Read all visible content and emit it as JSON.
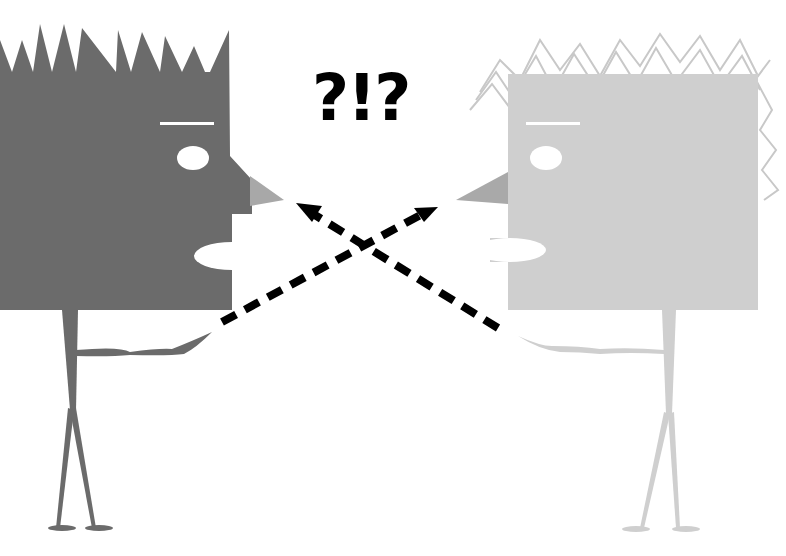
{
  "illustration": {
    "title": "Two square-headed figures pointing at each other",
    "exclamation_text": "?!?",
    "colors": {
      "background": "#ffffff",
      "left_figure": "#6b6b6b",
      "left_nose": "#a8a8a8",
      "right_figure": "#cfcfcf",
      "right_nose": "#a9a9a9",
      "eye": "#ffffff",
      "arrow": "#000000"
    },
    "left_figure": {
      "label": "left-figure",
      "hair": "spiky",
      "pointing": "right"
    },
    "right_figure": {
      "label": "right-figure",
      "hair": "scribbled",
      "pointing": "left"
    },
    "arrows": [
      {
        "from": "left-hand",
        "to": "right-nose",
        "style": "dashed"
      },
      {
        "from": "right-hand",
        "to": "left-nose",
        "style": "dashed"
      }
    ]
  }
}
